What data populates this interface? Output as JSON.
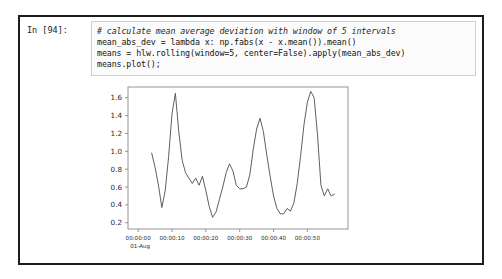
{
  "notebook": {
    "prompt_label": "In [94]:",
    "code_lines": [
      "# calculate mean average deviation with window of 5 intervals",
      "mean_abs_dev = lambda x: np.fabs(x - x.mean()).mean()",
      "means = hlw.rolling(window=5, center=False).apply(mean_abs_dev)",
      "means.plot();"
    ]
  },
  "colors": {
    "cell_border": "#1c1c1c",
    "input_border": "#cfcfcf",
    "input_background": "#fbfbfb",
    "code_text": "#141414",
    "axis": "#8a8a8a",
    "line": "#4d4d4d",
    "page_background": "#ffffff"
  },
  "chart_data": {
    "type": "line",
    "title": "",
    "xlabel": "",
    "ylabel": "",
    "grid": false,
    "legend": null,
    "ylim": [
      0.13,
      1.72
    ],
    "ytick_labels": [
      "0.2",
      "0.4",
      "0.6",
      "0.8",
      "1.0",
      "1.2",
      "1.4",
      "1.6"
    ],
    "ytick_values": [
      0.2,
      0.4,
      0.6,
      0.8,
      1.0,
      1.2,
      1.4,
      1.6
    ],
    "xtick_labels": [
      "00:00:00",
      "00:00:10",
      "00:00:20",
      "00:00:30",
      "00:00:40",
      "00:00:50"
    ],
    "xtick_secondary_label": "01-Aug",
    "xtick_values": [
      0,
      10,
      20,
      30,
      40,
      50
    ],
    "xlim": [
      -3,
      62
    ],
    "x": [
      4,
      5,
      6,
      7,
      8,
      9,
      10,
      11,
      12,
      13,
      14,
      15,
      16,
      17,
      18,
      19,
      20,
      21,
      22,
      23,
      24,
      25,
      26,
      27,
      28,
      29,
      30,
      31,
      32,
      33,
      34,
      35,
      36,
      37,
      38,
      39,
      40,
      41,
      42,
      43,
      44,
      45,
      46,
      47,
      48,
      49,
      50,
      51,
      52,
      53,
      54,
      55,
      56,
      57,
      58
    ],
    "series": [
      {
        "name": "means",
        "values": [
          0.98,
          0.82,
          0.62,
          0.37,
          0.56,
          0.94,
          1.42,
          1.65,
          1.22,
          0.9,
          0.76,
          0.7,
          0.64,
          0.7,
          0.62,
          0.72,
          0.56,
          0.38,
          0.26,
          0.32,
          0.46,
          0.6,
          0.76,
          0.86,
          0.78,
          0.62,
          0.58,
          0.58,
          0.6,
          0.74,
          1.02,
          1.25,
          1.37,
          1.22,
          0.96,
          0.72,
          0.5,
          0.36,
          0.3,
          0.3,
          0.36,
          0.33,
          0.42,
          0.64,
          0.95,
          1.3,
          1.55,
          1.67,
          1.6,
          1.18,
          0.62,
          0.5,
          0.58,
          0.5,
          0.52
        ]
      }
    ]
  }
}
